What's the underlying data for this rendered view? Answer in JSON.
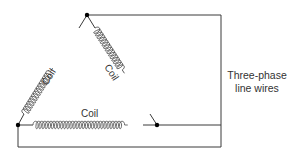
{
  "diagram": {
    "coils": [
      {
        "id": "left",
        "label": "Coil"
      },
      {
        "id": "right",
        "label": "Coil"
      },
      {
        "id": "bottom",
        "label": "Coil"
      }
    ],
    "line_wires_label": {
      "line1": "Three-phase",
      "line2": "line wires"
    },
    "colors": {
      "wire": "#3a3a3a",
      "node": "#000000",
      "text": "#333333"
    }
  }
}
